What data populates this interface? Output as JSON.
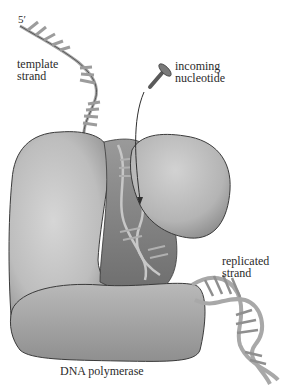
{
  "figure": {
    "labels": {
      "five_prime": "5′",
      "template_strand": "template\nstrand",
      "incoming_nucleotide": "incoming\nnucleotide",
      "replicated_strand": "replicated\nstrand",
      "dna_polymerase": "DNA polymerase"
    },
    "colors": {
      "background": "#ffffff",
      "protein_light": "#c9c9c9",
      "protein_mid": "#a7a7a7",
      "protein_dark": "#7a7a7a",
      "outline": "#3a3a3a",
      "dna_backbone": "#b8b8b8",
      "dna_rungs": "#9a9a9a"
    }
  }
}
